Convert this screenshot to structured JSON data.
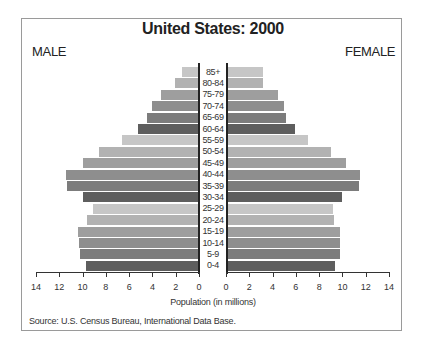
{
  "chart_data": {
    "type": "bar",
    "subtype": "population-pyramid",
    "title": "United States: 2000",
    "left_label": "MALE",
    "right_label": "FEMALE",
    "xlabel": "Population (in millions)",
    "source": "Source: U.S. Census Bureau, International Data Base.",
    "xlim": [
      0,
      14
    ],
    "ticks_left": [
      "14",
      "12",
      "10",
      "8",
      "6",
      "4",
      "2",
      "0"
    ],
    "ticks_right": [
      "0",
      "2",
      "4",
      "6",
      "8",
      "10",
      "12",
      "14"
    ],
    "categories": [
      "85+",
      "80-84",
      "75-79",
      "70-74",
      "65-69",
      "60-64",
      "55-59",
      "50-54",
      "45-49",
      "40-44",
      "35-39",
      "30-34",
      "25-29",
      "20-24",
      "15-19",
      "10-14",
      "5-9",
      "0-4"
    ],
    "series": [
      {
        "name": "MALE",
        "values": [
          1.5,
          2.1,
          3.3,
          4.0,
          4.5,
          5.2,
          6.6,
          8.6,
          10.0,
          11.4,
          11.3,
          10.0,
          9.1,
          9.6,
          10.4,
          10.3,
          10.2,
          9.7
        ]
      },
      {
        "name": "FEMALE",
        "values": [
          3.1,
          3.1,
          4.4,
          4.9,
          5.1,
          5.8,
          7.0,
          8.9,
          10.2,
          11.4,
          11.3,
          9.9,
          9.1,
          9.2,
          9.7,
          9.7,
          9.7,
          9.3
        ]
      }
    ],
    "bar_colors": [
      "#c6c6c6",
      "#b2b2b2",
      "#9e9e9e",
      "#8e8e8e",
      "#7c7c7c",
      "#5e5e5e"
    ],
    "grid": false,
    "legend": "none"
  }
}
